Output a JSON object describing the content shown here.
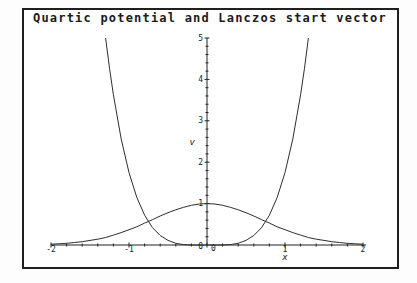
{
  "window": {
    "background": "#fdfdfd",
    "frame_color": "#1f1f1f",
    "plot_background": "#ffffff"
  },
  "chart_data": {
    "type": "line",
    "title": "Quartic potential and Lanczos start vector",
    "xlabel": "x",
    "ylabel": "v",
    "xlim": [
      -2,
      2
    ],
    "ylim": [
      0,
      5
    ],
    "grid": false,
    "legend": null,
    "axis_color": "#222222",
    "line_color": "#2e2e2e",
    "minor_tick_step": 0.2,
    "x_major_ticks": [
      -2,
      -1,
      0,
      1,
      2
    ],
    "x_labeled_ticks": [
      [
        -2,
        "-2"
      ],
      [
        -1,
        "-1"
      ],
      [
        1,
        "1"
      ],
      [
        2,
        "2"
      ]
    ],
    "y_major_ticks": [
      1,
      2,
      3,
      4,
      5
    ],
    "y_labeled_ticks": [
      [
        1,
        "1"
      ],
      [
        2,
        "2"
      ],
      [
        3,
        "3"
      ],
      [
        4,
        "4"
      ],
      [
        5,
        "5"
      ]
    ],
    "origin_labels": {
      "y_zero": "0",
      "x_zero": "0"
    },
    "series": [
      {
        "name": "Quartic potential",
        "points": [
          [
            -1.3,
            5.0
          ],
          [
            -1.25,
            4.27
          ],
          [
            -1.2,
            3.63
          ],
          [
            -1.1,
            2.56
          ],
          [
            -1.0,
            1.75
          ],
          [
            -0.9,
            1.15
          ],
          [
            -0.8,
            0.72
          ],
          [
            -0.7,
            0.42
          ],
          [
            -0.6,
            0.23
          ],
          [
            -0.5,
            0.11
          ],
          [
            -0.4,
            0.04
          ],
          [
            -0.3,
            0.01
          ],
          [
            -0.2,
            0.0
          ],
          [
            -0.1,
            0.0
          ],
          [
            0,
            0.0
          ],
          [
            0.1,
            0.0
          ],
          [
            0.2,
            0.0
          ],
          [
            0.3,
            0.01
          ],
          [
            0.4,
            0.04
          ],
          [
            0.5,
            0.11
          ],
          [
            0.6,
            0.23
          ],
          [
            0.7,
            0.42
          ],
          [
            0.8,
            0.72
          ],
          [
            0.9,
            1.15
          ],
          [
            1.0,
            1.75
          ],
          [
            1.1,
            2.56
          ],
          [
            1.2,
            3.63
          ],
          [
            1.25,
            4.27
          ],
          [
            1.3,
            5.0
          ]
        ]
      },
      {
        "name": "Lanczos start vector",
        "points": [
          [
            -2,
            0.02
          ],
          [
            -1.9,
            0.03
          ],
          [
            -1.8,
            0.04
          ],
          [
            -1.7,
            0.06
          ],
          [
            -1.6,
            0.08
          ],
          [
            -1.5,
            0.11
          ],
          [
            -1.4,
            0.14
          ],
          [
            -1.3,
            0.18
          ],
          [
            -1.2,
            0.24
          ],
          [
            -1.1,
            0.3
          ],
          [
            -1.0,
            0.37
          ],
          [
            -0.9,
            0.44
          ],
          [
            -0.8,
            0.53
          ],
          [
            -0.7,
            0.61
          ],
          [
            -0.6,
            0.7
          ],
          [
            -0.5,
            0.78
          ],
          [
            -0.4,
            0.85
          ],
          [
            -0.3,
            0.91
          ],
          [
            -0.2,
            0.96
          ],
          [
            -0.1,
            0.99
          ],
          [
            0,
            1.0
          ],
          [
            0.1,
            0.99
          ],
          [
            0.2,
            0.96
          ],
          [
            0.3,
            0.91
          ],
          [
            0.4,
            0.85
          ],
          [
            0.5,
            0.78
          ],
          [
            0.6,
            0.7
          ],
          [
            0.7,
            0.61
          ],
          [
            0.8,
            0.53
          ],
          [
            0.9,
            0.44
          ],
          [
            1.0,
            0.37
          ],
          [
            1.1,
            0.3
          ],
          [
            1.2,
            0.24
          ],
          [
            1.3,
            0.18
          ],
          [
            1.4,
            0.14
          ],
          [
            1.5,
            0.11
          ],
          [
            1.6,
            0.08
          ],
          [
            1.7,
            0.06
          ],
          [
            1.8,
            0.04
          ],
          [
            1.9,
            0.03
          ],
          [
            2,
            0.02
          ]
        ]
      }
    ]
  }
}
